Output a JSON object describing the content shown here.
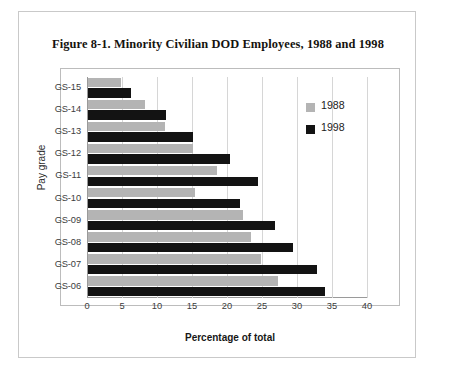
{
  "figure": {
    "caption": "Figure  8-1. Minority Civilian DOD Employees, 1988 and 1998"
  },
  "chart_data": {
    "type": "bar",
    "orientation": "horizontal",
    "title": "Figure  8-1. Minority Civilian DOD Employees, 1988 and 1998",
    "xlabel": "Percentage of total",
    "ylabel": "Pay grade",
    "categories": [
      "GS-15",
      "GS-14",
      "GS-13",
      "GS-12",
      "GS-11",
      "GS-10",
      "GS-09",
      "GS-08",
      "GS-07",
      "GS-06"
    ],
    "series": [
      {
        "name": "1988",
        "color": "#b4b4b4",
        "values": [
          4.7,
          8.1,
          11.0,
          15.0,
          18.4,
          15.3,
          22.1,
          23.3,
          24.7,
          27.1
        ]
      },
      {
        "name": "1998",
        "color": "#131313",
        "values": [
          6.1,
          11.1,
          15.0,
          20.3,
          24.3,
          21.7,
          26.7,
          29.3,
          32.7,
          33.9
        ]
      }
    ],
    "xticks": [
      0,
      5,
      10,
      15,
      20,
      25,
      30,
      35,
      40
    ],
    "xlim": [
      0,
      40
    ],
    "grid": true,
    "legend_position": "top-right",
    "legend": [
      "1988",
      "1998"
    ]
  }
}
